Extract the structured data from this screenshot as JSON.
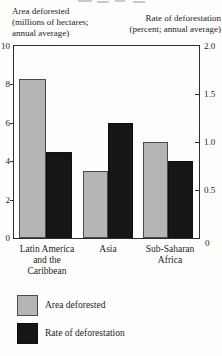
{
  "chart_data": {
    "type": "bar",
    "title": "",
    "categories": [
      "Latin America and the Caribbean",
      "Asia",
      "Sub-Saharan Africa"
    ],
    "category_labels": [
      "Latin America\nand the\nCaribbean",
      "Asia",
      "Sub-Saharan\nAfrica"
    ],
    "series": [
      {
        "name": "Area deforested",
        "axis": "left",
        "values": [
          8.3,
          3.5,
          5.0
        ],
        "color": "#b5b5b5"
      },
      {
        "name": "Rate of deforestation",
        "axis": "right",
        "values": [
          0.9,
          1.2,
          0.8
        ],
        "color": "#161616"
      }
    ],
    "left_axis": {
      "title": "Area deforested\n(millions of hectares;\nannual average)",
      "range": [
        0,
        10
      ],
      "ticks": [
        "10",
        "8",
        "6",
        "4",
        "2",
        "0"
      ]
    },
    "right_axis": {
      "title": "Rate of deforestation\n(percent; annual average)",
      "range": [
        0,
        2.0
      ],
      "ticks": [
        "2.0",
        "1.5",
        "1.0",
        "0.5",
        "0"
      ]
    },
    "grid": "off",
    "legend_position": "bottom-left"
  },
  "legend": {
    "items": [
      {
        "label": "Area deforested",
        "swatch_color": "#b5b5b5"
      },
      {
        "label": "Rate of deforestation",
        "swatch_color": "#161616"
      }
    ]
  }
}
